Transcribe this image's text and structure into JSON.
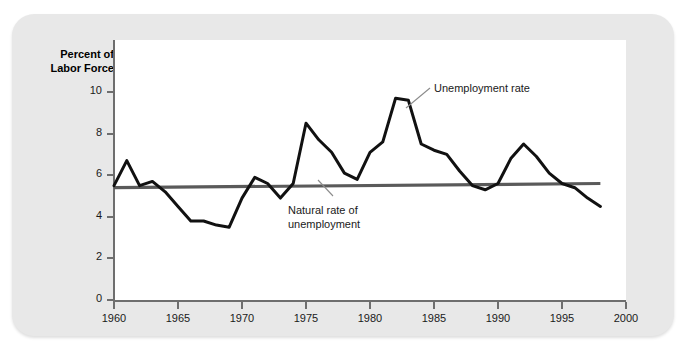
{
  "axis_title": {
    "line1": "Percent of",
    "line2": "Labor Force"
  },
  "annotations": {
    "unemployment": "Unemployment rate",
    "natural_line1": "Natural rate of",
    "natural_line2": "unemployment"
  },
  "colors": {
    "card_background": "#e8e8e8",
    "panel_background": "#ffffff",
    "axis": "#6e6e6e",
    "unemployment_line": "#111111",
    "natural_rate_line": "#5a5a5a",
    "text": "#1a1a1a",
    "leader_line": "#8c8c8c"
  },
  "chart_data": {
    "type": "line",
    "title": "",
    "xlabel": "",
    "ylabel": "Percent of Labor Force",
    "xlim": [
      1960,
      2000
    ],
    "ylim": [
      0,
      11
    ],
    "grid": false,
    "legend": "annotations",
    "xticks": [
      1960,
      1965,
      1970,
      1975,
      1980,
      1985,
      1990,
      1995,
      2000
    ],
    "yticks": [
      0,
      2,
      4,
      6,
      8,
      10
    ],
    "series": [
      {
        "name": "Unemployment rate",
        "x": [
          1960,
          1961,
          1962,
          1963,
          1964,
          1965,
          1966,
          1967,
          1968,
          1969,
          1970,
          1971,
          1972,
          1973,
          1974,
          1975,
          1976,
          1977,
          1978,
          1979,
          1980,
          1981,
          1982,
          1983,
          1984,
          1985,
          1986,
          1987,
          1988,
          1989,
          1990,
          1991,
          1992,
          1993,
          1994,
          1995,
          1996,
          1997,
          1998
        ],
        "values": [
          5.5,
          6.7,
          5.5,
          5.7,
          5.2,
          4.5,
          3.8,
          3.8,
          3.6,
          3.5,
          4.9,
          5.9,
          5.6,
          4.9,
          5.6,
          8.5,
          7.7,
          7.1,
          6.1,
          5.8,
          7.1,
          7.6,
          9.7,
          9.6,
          7.5,
          7.2,
          7.0,
          6.2,
          5.5,
          5.3,
          5.6,
          6.8,
          7.5,
          6.9,
          6.1,
          5.6,
          5.4,
          4.9,
          4.5
        ]
      },
      {
        "name": "Natural rate of unemployment",
        "x": [
          1960,
          1998
        ],
        "values": [
          5.4,
          5.6
        ]
      }
    ]
  }
}
